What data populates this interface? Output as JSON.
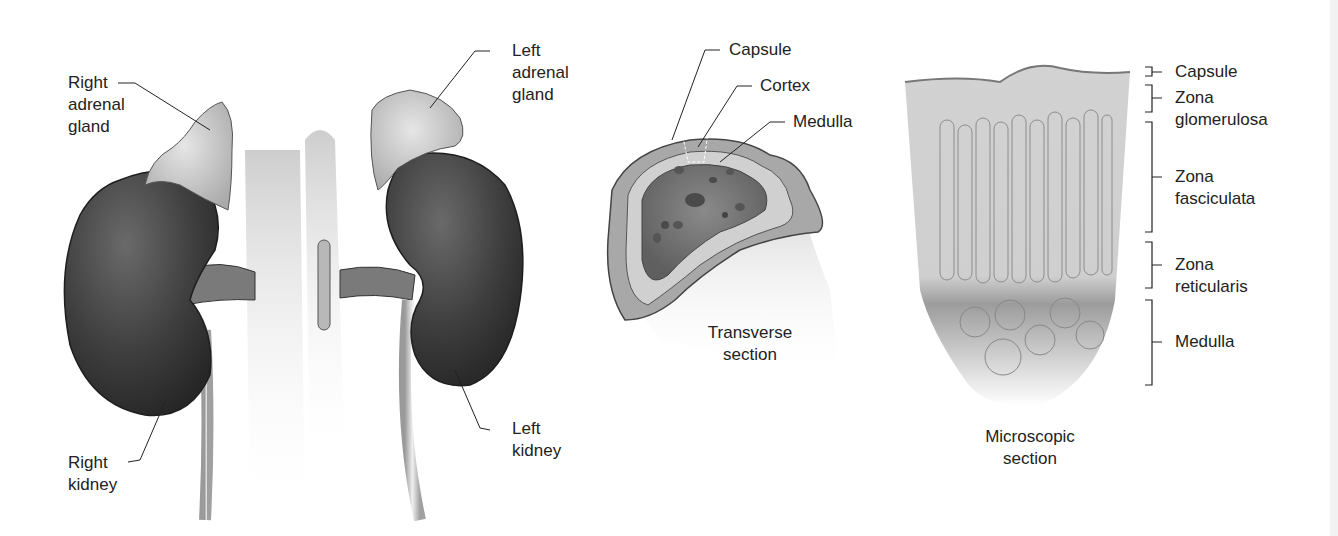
{
  "figure": {
    "panels": [
      {
        "id": "gross-anatomy",
        "labels": [
          {
            "key": "right_adrenal_gland",
            "lines": [
              "Right",
              "adrenal",
              "gland"
            ]
          },
          {
            "key": "left_adrenal_gland",
            "lines": [
              "Left",
              "adrenal",
              "gland"
            ]
          },
          {
            "key": "right_kidney",
            "lines": [
              "Right",
              "kidney"
            ]
          },
          {
            "key": "left_kidney",
            "lines": [
              "Left",
              "kidney"
            ]
          }
        ]
      },
      {
        "id": "transverse-section",
        "caption": [
          "Transverse",
          "section"
        ],
        "labels": [
          {
            "key": "capsule",
            "lines": [
              "Capsule"
            ]
          },
          {
            "key": "cortex",
            "lines": [
              "Cortex"
            ]
          },
          {
            "key": "medulla",
            "lines": [
              "Medulla"
            ]
          }
        ]
      },
      {
        "id": "microscopic-section",
        "caption": [
          "Microscopic",
          "section"
        ],
        "labels": [
          {
            "key": "capsule",
            "lines": [
              "Capsule"
            ]
          },
          {
            "key": "zona_glomerulosa",
            "lines": [
              "Zona",
              "glomerulosa"
            ]
          },
          {
            "key": "zona_fasciculata",
            "lines": [
              "Zona",
              "fasciculata"
            ]
          },
          {
            "key": "zona_reticularis",
            "lines": [
              "Zona",
              "reticularis"
            ]
          },
          {
            "key": "medulla",
            "lines": [
              "Medulla"
            ]
          }
        ]
      }
    ]
  }
}
